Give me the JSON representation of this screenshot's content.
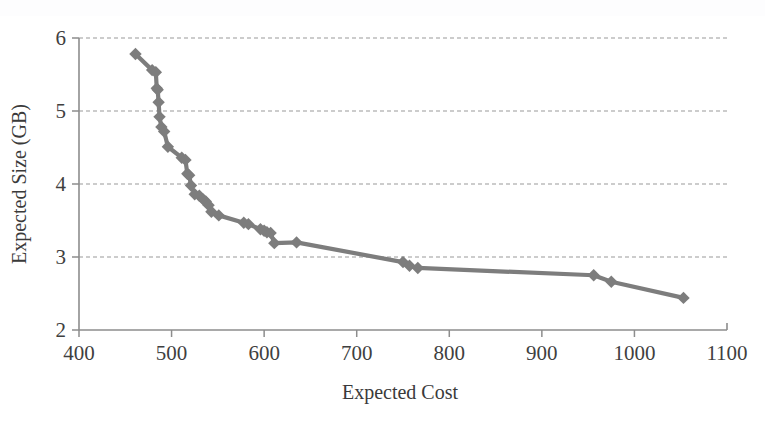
{
  "chart_data": {
    "type": "line",
    "title": "",
    "subtitle": "",
    "xlabel": "Expected Cost",
    "ylabel": "Expected Size (GB)",
    "xlim": [
      400,
      1100
    ],
    "ylim": [
      2,
      6
    ],
    "xticks": [
      400,
      500,
      600,
      700,
      800,
      900,
      1000,
      1100
    ],
    "yticks": [
      2,
      3,
      4,
      5,
      6
    ],
    "xtick_labels": [
      "400",
      "500",
      "600",
      "700",
      "800",
      "900",
      "1000",
      "1100"
    ],
    "ytick_labels": [
      "2",
      "3",
      "4",
      "5",
      "6"
    ],
    "grid": {
      "horizontal": true,
      "vertical": false,
      "style": "dashed",
      "color": "#9a9a9a"
    },
    "legend": {
      "visible": false,
      "position": "none",
      "entries": []
    },
    "annotations": [],
    "series": [
      {
        "name": "Pareto frontier",
        "marker": "diamond",
        "color": "#7d7d7d",
        "line_color": "#7d7d7d",
        "x": [
          461,
          479,
          483,
          484,
          485,
          486,
          487,
          489,
          492,
          496,
          511,
          515,
          517,
          519,
          521,
          525,
          530,
          534,
          537,
          540,
          543,
          551,
          578,
          583,
          596,
          600,
          603,
          607,
          611,
          635,
          750,
          757,
          766,
          956,
          975,
          1053
        ],
        "y": [
          5.78,
          5.56,
          5.53,
          5.31,
          5.29,
          5.12,
          4.92,
          4.78,
          4.72,
          4.51,
          4.36,
          4.33,
          4.14,
          4.12,
          3.98,
          3.86,
          3.84,
          3.79,
          3.76,
          3.71,
          3.62,
          3.57,
          3.47,
          3.45,
          3.38,
          3.36,
          3.34,
          3.33,
          3.19,
          3.2,
          2.93,
          2.88,
          2.85,
          2.75,
          2.66,
          2.44
        ]
      }
    ]
  },
  "axes": {
    "x_axis_name": "expected-cost-axis",
    "y_axis_name": "expected-size-axis"
  },
  "figure": {
    "background_color": "#ffffff",
    "accent_color": "#7d7d7d"
  }
}
